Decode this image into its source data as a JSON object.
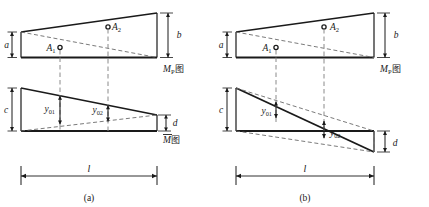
{
  "figure": {
    "colors": {
      "stroke": "#1a1a1a",
      "dashed": "#6b6b6b",
      "baseline": "#4a4a4a",
      "background": "#ffffff"
    },
    "panels": [
      {
        "id": "a",
        "caption": "(a)",
        "diagrams": [
          {
            "name": "Mp-diagram",
            "label": "M",
            "label_sub": "P",
            "label_suffix": "图",
            "shape": "trapezoid",
            "dimensions": [
              {
                "name": "a",
                "label": "a",
                "side": "left",
                "meaning": "left ordinate of Mp diagram"
              },
              {
                "name": "b",
                "label": "b",
                "side": "right",
                "meaning": "right ordinate of Mp diagram"
              }
            ],
            "centroids": [
              {
                "name": "A1",
                "label": "A",
                "sub": "1",
                "marker": "open-circle"
              },
              {
                "name": "A2",
                "label": "A",
                "sub": "2",
                "marker": "open-circle"
              }
            ]
          },
          {
            "name": "M-bar-diagram",
            "label": "M",
            "label_overline": true,
            "label_suffix": "图",
            "shape": "trapezoid",
            "dimensions": [
              {
                "name": "c",
                "label": "c",
                "side": "left",
                "meaning": "left ordinate of M-bar diagram"
              },
              {
                "name": "d",
                "label": "d",
                "side": "right",
                "meaning": "right ordinate of M-bar diagram"
              }
            ],
            "ordinates": [
              {
                "name": "y01",
                "label": "y",
                "sub": "01"
              },
              {
                "name": "y02",
                "label": "y",
                "sub": "02"
              }
            ]
          }
        ],
        "span": {
          "name": "l",
          "label": "l"
        }
      },
      {
        "id": "b",
        "caption": "(b)",
        "diagrams": [
          {
            "name": "Mp-diagram",
            "label": "M",
            "label_sub": "P",
            "label_suffix": "图",
            "shape": "trapezoid",
            "dimensions": [
              {
                "name": "a",
                "label": "a",
                "side": "left",
                "meaning": "left ordinate of Mp diagram"
              },
              {
                "name": "b",
                "label": "b",
                "side": "right",
                "meaning": "right ordinate of Mp diagram"
              }
            ],
            "centroids": [
              {
                "name": "A1",
                "label": "A",
                "sub": "1",
                "marker": "open-circle"
              },
              {
                "name": "A2",
                "label": "A",
                "sub": "2",
                "marker": "open-circle"
              }
            ]
          },
          {
            "name": "M-bar-diagram",
            "label": "M",
            "label_overline": true,
            "label_suffix": "图",
            "shape": "sign-changing-triangle-pair",
            "dimensions": [
              {
                "name": "c",
                "label": "c",
                "side": "left",
                "meaning": "left ordinate of M-bar diagram"
              },
              {
                "name": "d",
                "label": "d",
                "side": "right",
                "meaning": "right ordinate of M-bar diagram"
              }
            ],
            "ordinates": [
              {
                "name": "y01",
                "label": "y",
                "sub": "01"
              },
              {
                "name": "y02",
                "label": "y",
                "sub": "02"
              }
            ]
          }
        ],
        "span": {
          "name": "l",
          "label": "l"
        }
      }
    ]
  }
}
